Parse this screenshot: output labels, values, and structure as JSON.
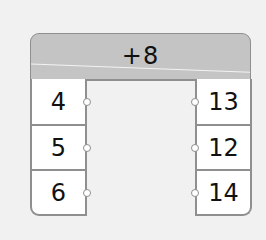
{
  "machine": {
    "operation": "+8",
    "inputs": [
      "4",
      "5",
      "6"
    ],
    "outputs": [
      "13",
      "12",
      "14"
    ]
  },
  "colors": {
    "background": "#f1f1f1",
    "header": "#c4c4c4",
    "border": "#8f8f8f",
    "cell": "#ffffff"
  }
}
